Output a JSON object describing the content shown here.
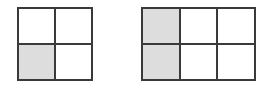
{
  "figure": {
    "background_color": "#ffffff",
    "line_color": "#3a3a3a",
    "shaded_color": "#dddddd",
    "unshaded_color": "#ffffff",
    "line_width_px": 2
  },
  "grids": [
    {
      "id": "grid-left",
      "name": "two-by-two-grid",
      "columns": 2,
      "rows": 2,
      "total_cells": 4,
      "shaded_cells": 1,
      "fraction_label": "1/4",
      "cells": [
        {
          "index": 0,
          "row": 1,
          "column": 1,
          "state": "unshaded",
          "fill": "#ffffff"
        },
        {
          "index": 1,
          "row": 1,
          "column": 2,
          "state": "unshaded",
          "fill": "#ffffff"
        },
        {
          "index": 2,
          "row": 2,
          "column": 1,
          "state": "shaded",
          "fill": "#dddddd"
        },
        {
          "index": 3,
          "row": 2,
          "column": 2,
          "state": "unshaded",
          "fill": "#ffffff"
        }
      ]
    },
    {
      "id": "grid-right",
      "name": "three-by-two-grid",
      "columns": 3,
      "rows": 2,
      "total_cells": 6,
      "shaded_cells": 2,
      "fraction_label": "2/6",
      "cells": [
        {
          "index": 0,
          "row": 1,
          "column": 1,
          "state": "shaded",
          "fill": "#dddddd"
        },
        {
          "index": 1,
          "row": 1,
          "column": 2,
          "state": "unshaded",
          "fill": "#ffffff"
        },
        {
          "index": 2,
          "row": 1,
          "column": 3,
          "state": "unshaded",
          "fill": "#ffffff"
        },
        {
          "index": 3,
          "row": 2,
          "column": 1,
          "state": "shaded",
          "fill": "#dddddd"
        },
        {
          "index": 4,
          "row": 2,
          "column": 2,
          "state": "unshaded",
          "fill": "#ffffff"
        },
        {
          "index": 5,
          "row": 2,
          "column": 3,
          "state": "unshaded",
          "fill": "#ffffff"
        }
      ]
    }
  ]
}
